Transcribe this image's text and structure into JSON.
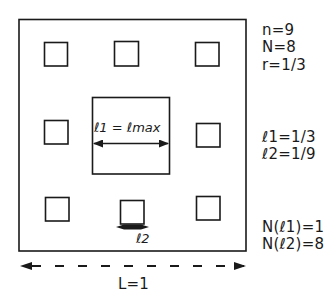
{
  "diagram": {
    "title": "",
    "outer_square": {
      "label": "",
      "x": 18,
      "y": 19,
      "w": 228,
      "h": 232
    },
    "center_square": {
      "x": 92,
      "y": 97,
      "w": 78,
      "h": 77
    },
    "small_squares": [
      {
        "x": 44,
        "y": 42,
        "w": 23,
        "h": 24
      },
      {
        "x": 114,
        "y": 41,
        "w": 24,
        "h": 25
      },
      {
        "x": 195,
        "y": 42,
        "w": 24,
        "h": 24
      },
      {
        "x": 44,
        "y": 120,
        "w": 24,
        "h": 24
      },
      {
        "x": 196,
        "y": 123,
        "w": 24,
        "h": 24
      },
      {
        "x": 45,
        "y": 197,
        "w": 24,
        "h": 24
      },
      {
        "x": 120,
        "y": 200,
        "w": 24,
        "h": 24
      },
      {
        "x": 196,
        "y": 196,
        "w": 24,
        "h": 24
      }
    ],
    "center_label": "ℓ1 = ℓmax",
    "small_label": "ℓ2",
    "length_label": "L=1",
    "parameters": {
      "n": "n=9",
      "N": "N=8",
      "r": "r=1/3"
    },
    "lengths": {
      "l1": "ℓ1=1/3",
      "l2": "ℓ2=1/9"
    },
    "counts": {
      "N_l1": "N(ℓ1)=1",
      "N_l2": "N(ℓ2)=8"
    },
    "colors": {
      "stroke": "#1a1a1a",
      "background": "#ffffff"
    }
  }
}
